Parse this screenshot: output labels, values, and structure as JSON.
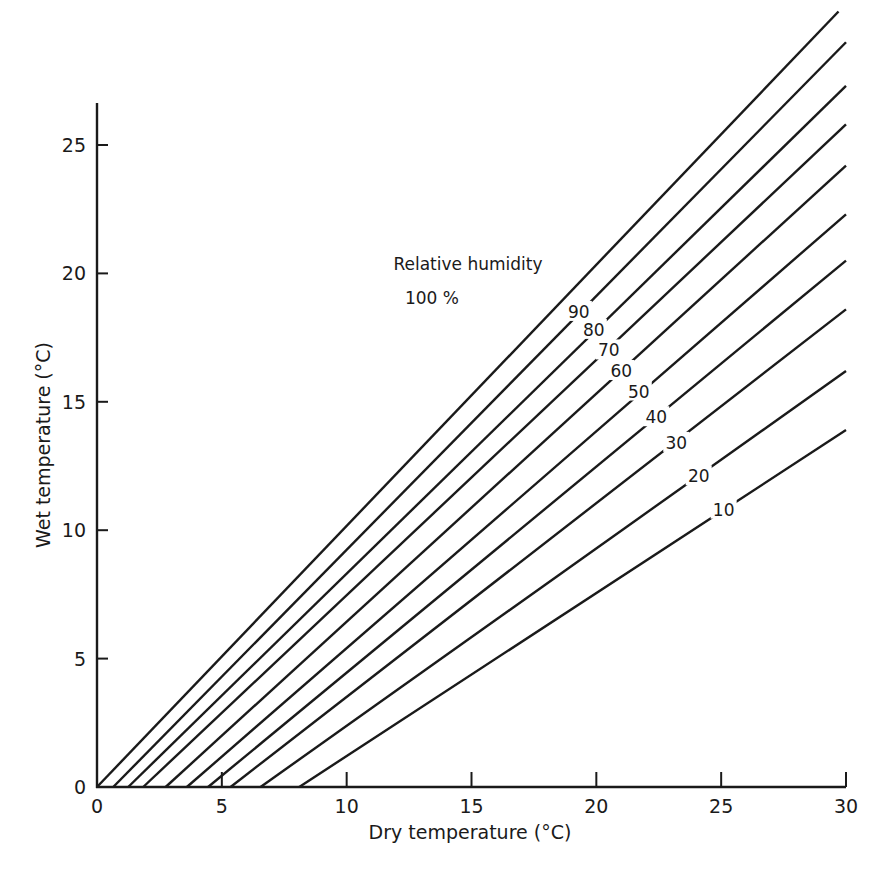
{
  "chart_data": {
    "type": "line",
    "title": "",
    "xlabel": "Dry temperature (°C)",
    "ylabel": "Wet temperature (°C)",
    "xlim": [
      0,
      30
    ],
    "ylim": [
      0,
      26.5
    ],
    "xticks": [
      0,
      5,
      10,
      15,
      20,
      25,
      30
    ],
    "yticks": [
      0,
      5,
      10,
      15,
      20,
      25
    ],
    "grid": false,
    "legend": "none (curves labeled inline)",
    "annotation": {
      "title": "Relative humidity",
      "first_label": "100 %"
    },
    "series": [
      {
        "name": "100",
        "label": "100 %",
        "x": [
          0.0,
          29.7
        ],
        "y": [
          0.0,
          30.2
        ]
      },
      {
        "name": "90",
        "label": "90",
        "x": [
          0.65,
          30
        ],
        "y": [
          0.0,
          29.0
        ]
      },
      {
        "name": "80",
        "label": "80",
        "x": [
          1.25,
          30
        ],
        "y": [
          0.0,
          27.3
        ]
      },
      {
        "name": "70",
        "label": "70",
        "x": [
          1.85,
          30
        ],
        "y": [
          0.0,
          25.8
        ]
      },
      {
        "name": "60",
        "label": "60",
        "x": [
          2.75,
          30
        ],
        "y": [
          0.0,
          24.2
        ]
      },
      {
        "name": "50",
        "label": "50",
        "x": [
          3.6,
          30
        ],
        "y": [
          0.0,
          22.3
        ]
      },
      {
        "name": "40",
        "label": "40",
        "x": [
          4.45,
          30
        ],
        "y": [
          0.0,
          20.5
        ]
      },
      {
        "name": "30",
        "label": "30",
        "x": [
          5.35,
          30
        ],
        "y": [
          0.0,
          18.6
        ]
      },
      {
        "name": "20",
        "label": "20",
        "x": [
          6.55,
          30
        ],
        "y": [
          0.0,
          16.2
        ]
      },
      {
        "name": "10",
        "label": "10",
        "x": [
          8.1,
          30
        ],
        "y": [
          0.0,
          13.9
        ]
      }
    ],
    "label_positions": [
      {
        "name": "90",
        "x": 19.3,
        "y": 18.5
      },
      {
        "name": "80",
        "x": 19.9,
        "y": 17.8
      },
      {
        "name": "70",
        "x": 20.5,
        "y": 17.0
      },
      {
        "name": "60",
        "x": 21.0,
        "y": 16.2
      },
      {
        "name": "50",
        "x": 21.7,
        "y": 15.4
      },
      {
        "name": "40",
        "x": 22.4,
        "y": 14.4
      },
      {
        "name": "30",
        "x": 23.2,
        "y": 13.4
      },
      {
        "name": "20",
        "x": 24.1,
        "y": 12.1
      },
      {
        "name": "10",
        "x": 25.1,
        "y": 10.8
      }
    ]
  },
  "axes": {
    "x_title": "Dry temperature (°C)",
    "y_title": "Wet temperature (°C)",
    "x_ticks": [
      "0",
      "5",
      "10",
      "15",
      "20",
      "25",
      "30"
    ],
    "y_ticks": [
      "0",
      "5",
      "10",
      "15",
      "20",
      "25"
    ]
  },
  "annotation": {
    "title": "Relative humidity",
    "first": "100 %",
    "labels": [
      "90",
      "80",
      "70",
      "60",
      "50",
      "40",
      "30",
      "20",
      "10"
    ]
  },
  "colors": {
    "ink": "#1a1a1a",
    "background": "#ffffff"
  }
}
